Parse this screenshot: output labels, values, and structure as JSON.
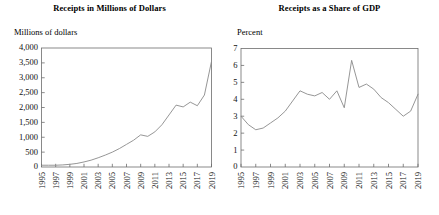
{
  "figure": {
    "panels": [
      {
        "id": "receipts-millions",
        "title": "Receipts in Millions of Dollars",
        "unit_label": "Millions of dollars"
      },
      {
        "id": "receipts-share-gdp",
        "title": "Receipts as a Share of GDP",
        "unit_label": "Percent"
      }
    ]
  },
  "chart_data": [
    {
      "type": "line",
      "title": "Receipts in Millions of Dollars",
      "xlabel": "",
      "ylabel": "Millions of dollars",
      "xlim": [
        1995,
        2019
      ],
      "ylim": [
        0,
        4000
      ],
      "yticks": [
        0,
        500,
        1000,
        1500,
        2000,
        2500,
        3000,
        3500,
        4000
      ],
      "ytick_labels": [
        "0",
        "500",
        "1,000",
        "1,500",
        "2,000",
        "2,500",
        "3,000",
        "3,500",
        "4,000"
      ],
      "xticks": [
        1995,
        1997,
        1999,
        2001,
        2003,
        2005,
        2007,
        2009,
        2011,
        2013,
        2015,
        2017,
        2019
      ],
      "xtick_labels": [
        "1995",
        "1997",
        "1999",
        "2001",
        "2003",
        "2005",
        "2007",
        "2009",
        "2011",
        "2013",
        "2015",
        "2017",
        "2019"
      ],
      "grid": false,
      "legend": "none",
      "x": [
        1995,
        1996,
        1997,
        1998,
        1999,
        2000,
        2001,
        2002,
        2003,
        2004,
        2005,
        2006,
        2007,
        2008,
        2009,
        2010,
        2011,
        2012,
        2013,
        2014,
        2015,
        2016,
        2017,
        2018,
        2019
      ],
      "values": [
        60,
        60,
        60,
        70,
        90,
        120,
        170,
        230,
        310,
        400,
        500,
        620,
        760,
        900,
        1080,
        1030,
        1180,
        1420,
        1750,
        2080,
        2020,
        2180,
        2060,
        2420,
        3550
      ]
    },
    {
      "type": "line",
      "title": "Receipts as a Share of GDP",
      "xlabel": "",
      "ylabel": "Percent",
      "xlim": [
        1995,
        2019
      ],
      "ylim": [
        0,
        7
      ],
      "yticks": [
        0,
        1,
        2,
        3,
        4,
        5,
        6,
        7
      ],
      "ytick_labels": [
        "0",
        "1",
        "2",
        "3",
        "4",
        "5",
        "6",
        "7"
      ],
      "xticks": [
        1995,
        1997,
        1999,
        2001,
        2003,
        2005,
        2007,
        2009,
        2011,
        2013,
        2015,
        2017,
        2019
      ],
      "xtick_labels": [
        "1995",
        "1997",
        "1999",
        "2001",
        "2003",
        "2005",
        "2007",
        "2009",
        "2011",
        "2013",
        "2015",
        "2017",
        "2019"
      ],
      "grid": false,
      "legend": "none",
      "x": [
        1995,
        1996,
        1997,
        1998,
        1999,
        2000,
        2001,
        2002,
        2003,
        2004,
        2005,
        2006,
        2007,
        2008,
        2009,
        2010,
        2011,
        2012,
        2013,
        2014,
        2015,
        2016,
        2017,
        2018,
        2019
      ],
      "values": [
        3.0,
        2.5,
        2.2,
        2.3,
        2.6,
        2.9,
        3.3,
        3.9,
        4.5,
        4.3,
        4.2,
        4.4,
        4.0,
        4.5,
        3.5,
        6.3,
        4.7,
        4.9,
        4.6,
        4.1,
        3.8,
        3.4,
        3.0,
        3.3,
        4.3
      ]
    }
  ]
}
